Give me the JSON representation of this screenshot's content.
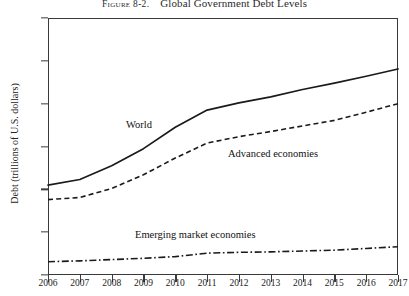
{
  "figure": {
    "number": "Figure 8-2.",
    "title": "Global Government Debt Levels"
  },
  "chart_data": {
    "type": "line",
    "title": "Global Government Debt Levels",
    "xlabel": "",
    "ylabel": "Debt (trillions of U.S. dollars)",
    "xlim": [
      2006,
      2017
    ],
    "ylim": [
      0,
      60
    ],
    "yticks": [
      0,
      10,
      20,
      30,
      40,
      50,
      60
    ],
    "grid": false,
    "legend": "inline-annotations",
    "categories": [
      "2006",
      "2007",
      "2008",
      "2009",
      "2010",
      "2011",
      "2012",
      "2013",
      "2014",
      "2015",
      "2016",
      "2017"
    ],
    "series": [
      {
        "name": "World",
        "style": "solid",
        "color": "#1a1a1a",
        "values": [
          21.0,
          22.3,
          25.5,
          29.5,
          34.5,
          38.5,
          40.2,
          41.6,
          43.3,
          44.8,
          46.4,
          48.1
        ]
      },
      {
        "name": "Advanced economies",
        "style": "dashed",
        "color": "#1a1a1a",
        "values": [
          17.6,
          18.1,
          20.2,
          23.4,
          27.3,
          30.8,
          32.3,
          33.5,
          34.8,
          36.1,
          38.0,
          40.0
        ]
      },
      {
        "name": "Emerging market economies",
        "style": "dash-dot",
        "color": "#1a1a1a",
        "values": [
          3.1,
          3.3,
          3.6,
          3.9,
          4.3,
          5.1,
          5.3,
          5.4,
          5.6,
          5.8,
          6.2,
          6.6
        ]
      }
    ],
    "annotations": [
      {
        "text": "World",
        "x": 2010,
        "y": 36.5
      },
      {
        "text": "Advanced economies",
        "x": 2013,
        "y": 28.5
      },
      {
        "text": "Emerging market economies",
        "x": 2010,
        "y": 11.5
      }
    ]
  },
  "axes": {
    "y_tick_labels": [
      "60",
      "50",
      "40",
      "30",
      "20",
      "10",
      "0"
    ],
    "x_tick_labels": [
      "2006",
      "2007",
      "2008",
      "2009",
      "2010",
      "2011",
      "2012",
      "2013",
      "2014",
      "2015",
      "2016",
      "2017"
    ]
  }
}
